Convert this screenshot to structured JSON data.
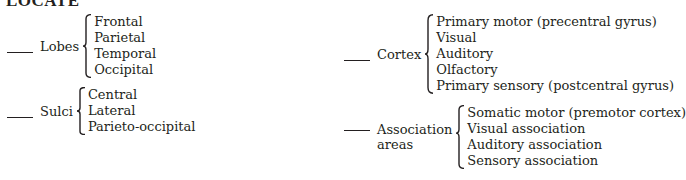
{
  "title": "LOCATE",
  "groups": {
    "lobes": {
      "label": "Lobes",
      "items": [
        "Frontal",
        "Parietal",
        "Temporal",
        "Occipital"
      ]
    },
    "sulci": {
      "label": "Sulci",
      "items": [
        "Central",
        "Lateral",
        "Parieto-occipital"
      ]
    },
    "cortex": {
      "label": "Cortex",
      "items": [
        "Primary motor (precentral gyrus)",
        "Visual",
        "Auditory",
        "Olfactory",
        "Primary sensory (postcentral gyrus)"
      ]
    },
    "association": {
      "label_line1": "Association",
      "label_line2": "areas",
      "items": [
        "Somatic motor (premotor cortex)",
        "Visual association",
        "Auditory association",
        "Sensory association"
      ]
    }
  }
}
